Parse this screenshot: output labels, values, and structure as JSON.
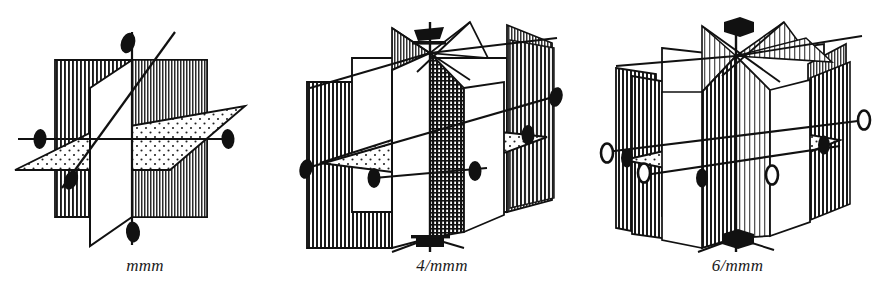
{
  "figure": {
    "kind": "line-drawing",
    "background_color": "#ffffff",
    "ink_color": "#111111",
    "panel_count": 3
  },
  "panels": [
    {
      "id": "mmm",
      "caption": "mmm",
      "crystal_system": "orthorhombic",
      "principal_axis_order": 2,
      "principal_axis_symbol": "filled-lens",
      "mirror_planes": {
        "vertical_count": 2,
        "horizontal_count": 1,
        "total": 3
      },
      "axis_markers": [
        {
          "position": "top",
          "symbol": "filled-lens",
          "fold": 2
        },
        {
          "position": "bottom",
          "symbol": "filled-lens",
          "fold": 2
        },
        {
          "position": "left",
          "symbol": "filled-lens",
          "fold": 2
        },
        {
          "position": "right",
          "symbol": "filled-lens",
          "fold": 2
        },
        {
          "position": "front-center",
          "symbol": "filled-lens",
          "fold": 2
        }
      ],
      "plane_fills": [
        "vertical-line-hatch",
        "white",
        "stipple-dots"
      ]
    },
    {
      "id": "4mmm",
      "caption": "4/mmm",
      "crystal_system": "tetragonal",
      "principal_axis_order": 4,
      "principal_axis_symbol": "filled-square",
      "mirror_planes": {
        "vertical_count": 4,
        "horizontal_count": 1,
        "total": 5
      },
      "axis_markers": [
        {
          "position": "top",
          "symbol": "filled-square",
          "fold": 4
        },
        {
          "position": "bottom",
          "symbol": "filled-square",
          "fold": 4
        },
        {
          "position": "left",
          "symbol": "filled-lens",
          "fold": 2
        },
        {
          "position": "right",
          "symbol": "filled-lens",
          "fold": 2
        },
        {
          "position": "front-left",
          "symbol": "filled-lens",
          "fold": 2
        },
        {
          "position": "front-right",
          "symbol": "filled-lens",
          "fold": 2
        },
        {
          "position": "back-right",
          "symbol": "filled-lens",
          "fold": 2
        }
      ],
      "plane_fills": [
        "vertical-line-hatch",
        "cross-hatch",
        "white",
        "stipple-dots"
      ]
    },
    {
      "id": "6mmm",
      "caption": "6/mmm",
      "crystal_system": "hexagonal",
      "principal_axis_order": 6,
      "principal_axis_symbol": "filled-hexagon",
      "mirror_planes": {
        "vertical_count": 6,
        "horizontal_count": 1,
        "total": 7
      },
      "axis_markers": [
        {
          "position": "top",
          "symbol": "filled-hexagon",
          "fold": 6
        },
        {
          "position": "bottom",
          "symbol": "filled-hexagon",
          "fold": 6
        },
        {
          "position": "left-outer",
          "symbol": "open-lens",
          "fold": 2
        },
        {
          "position": "left-inner",
          "symbol": "filled-lens",
          "fold": 2
        },
        {
          "position": "left-low",
          "symbol": "open-lens",
          "fold": 2
        },
        {
          "position": "front-left",
          "symbol": "filled-lens",
          "fold": 2
        },
        {
          "position": "front-right",
          "symbol": "open-lens",
          "fold": 2
        },
        {
          "position": "right-inner",
          "symbol": "filled-lens",
          "fold": 2
        },
        {
          "position": "right-outer",
          "symbol": "open-lens",
          "fold": 2
        }
      ],
      "plane_fills": [
        "vertical-line-hatch",
        "white",
        "stipple-dots"
      ]
    }
  ]
}
